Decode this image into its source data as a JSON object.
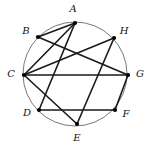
{
  "figure": {
    "width": 149,
    "height": 146,
    "background_color": "#ffffff",
    "circle": {
      "center_x": 75,
      "center_y": 74,
      "radius": 52,
      "stroke_color": "#555555",
      "stroke_width": 0.8,
      "fill": "none"
    },
    "chord_style": {
      "stroke_color": "#1a1a1a",
      "stroke_width": 1.6
    },
    "vertex_style": {
      "fill_color": "#000000",
      "radius": 2.1
    },
    "vertices": [
      {
        "id": "A",
        "label": "A",
        "x": 75,
        "y": 23,
        "label_x": 73,
        "label_y": 9
      },
      {
        "id": "B",
        "label": "B",
        "x": 38,
        "y": 37,
        "label_x": 26,
        "label_y": 31
      },
      {
        "id": "C",
        "label": "C",
        "x": 24,
        "y": 75,
        "label_x": 11,
        "label_y": 74
      },
      {
        "id": "D",
        "label": "D",
        "x": 39,
        "y": 110,
        "label_x": 27,
        "label_y": 113
      },
      {
        "id": "E",
        "label": "E",
        "x": 77,
        "y": 124,
        "label_x": 77,
        "label_y": 138
      },
      {
        "id": "F",
        "label": "F",
        "x": 115,
        "y": 110,
        "label_x": 126,
        "label_y": 114
      },
      {
        "id": "G",
        "label": "G",
        "x": 128,
        "y": 75,
        "label_x": 140,
        "label_y": 74
      },
      {
        "id": "H",
        "label": "H",
        "x": 114,
        "y": 38,
        "label_x": 124,
        "label_y": 31
      }
    ],
    "chords": [
      {
        "from": "A",
        "to": "B"
      },
      {
        "from": "A",
        "to": "C"
      },
      {
        "from": "A",
        "to": "D"
      },
      {
        "from": "B",
        "to": "G"
      },
      {
        "from": "C",
        "to": "H"
      },
      {
        "from": "C",
        "to": "G"
      },
      {
        "from": "C",
        "to": "E"
      },
      {
        "from": "D",
        "to": "F"
      },
      {
        "from": "E",
        "to": "H"
      },
      {
        "from": "F",
        "to": "G"
      }
    ]
  }
}
